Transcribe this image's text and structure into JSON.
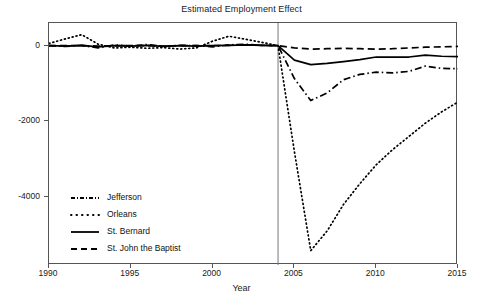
{
  "chart_data": {
    "type": "line",
    "title": "Estimated Employment Effect",
    "xlabel": "Year",
    "ylabel": "",
    "xlim": [
      1990,
      2015
    ],
    "ylim": [
      -5800,
      600
    ],
    "xticks": [
      1990,
      1995,
      2000,
      2005,
      2010,
      2015
    ],
    "xticklabels": [
      "1990",
      "1995",
      "2000",
      "2005",
      "2010",
      "2015"
    ],
    "yticks": [
      0,
      -2000,
      -4000
    ],
    "yticklabels": [
      "0",
      "-2000",
      "-4000"
    ],
    "grid": false,
    "legend_position": "lower left",
    "annotations": [
      {
        "type": "vline",
        "x": 2004,
        "label": "",
        "color": "#777777"
      }
    ],
    "x": [
      1990,
      1991,
      1992,
      1993,
      1994,
      1995,
      1996,
      1997,
      1998,
      1999,
      2000,
      2001,
      2002,
      2003,
      2004,
      2005,
      2006,
      2007,
      2008,
      2009,
      2010,
      2011,
      2012,
      2013,
      2014,
      2015
    ],
    "series": [
      {
        "name": "Jefferson",
        "style": "dash-dot",
        "color": "#000000",
        "values": [
          0,
          -20,
          10,
          -60,
          20,
          -10,
          30,
          -20,
          10,
          0,
          -30,
          20,
          40,
          10,
          0,
          -870,
          -1450,
          -1250,
          -900,
          -760,
          -700,
          -720,
          -680,
          -540,
          -600,
          -610
        ]
      },
      {
        "name": "Orleans",
        "style": "dotted",
        "color": "#000000",
        "values": [
          60,
          180,
          290,
          40,
          -60,
          -40,
          -70,
          -50,
          -90,
          -60,
          120,
          250,
          170,
          90,
          0,
          -2800,
          -5420,
          -4900,
          -4200,
          -3650,
          -3150,
          -2750,
          -2400,
          -2050,
          -1750,
          -1490
        ]
      },
      {
        "name": "St. Bernard",
        "style": "solid",
        "color": "#000000",
        "values": [
          0,
          -10,
          10,
          -30,
          0,
          -10,
          10,
          -20,
          0,
          -10,
          0,
          10,
          20,
          10,
          0,
          -380,
          -500,
          -470,
          -420,
          -370,
          -300,
          -300,
          -300,
          -250,
          -280,
          -290
        ]
      },
      {
        "name": "St. John the Baptist",
        "style": "dashed",
        "color": "#000000",
        "values": [
          0,
          0,
          0,
          -10,
          0,
          0,
          0,
          -10,
          0,
          0,
          0,
          10,
          20,
          10,
          0,
          -60,
          -90,
          -80,
          -70,
          -80,
          -90,
          -80,
          -60,
          -40,
          -30,
          -20
        ]
      }
    ]
  },
  "legend": {
    "items": [
      {
        "label": "Jefferson",
        "dash": "4,2,1,2"
      },
      {
        "label": "Orleans",
        "dash": "1,3"
      },
      {
        "label": "St. Bernard",
        "dash": "none"
      },
      {
        "label": "St. John the Baptist",
        "dash": "6,4"
      }
    ]
  }
}
